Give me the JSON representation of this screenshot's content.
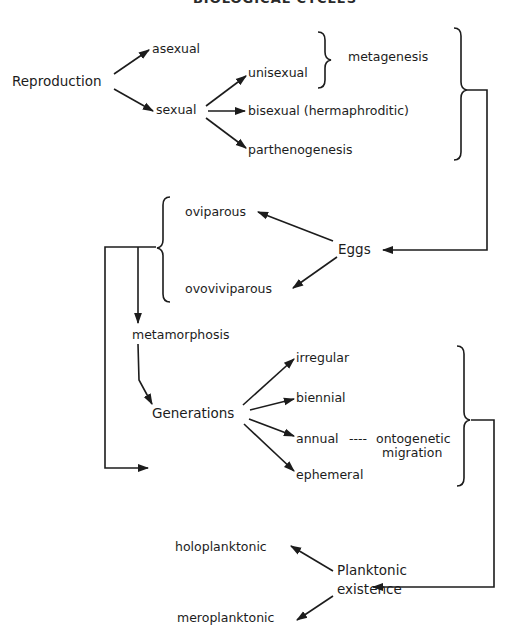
{
  "header": {
    "title": "BIOLOGICAL CYCLES"
  },
  "nodes": {
    "reproduction": "Reproduction",
    "asexual": "asexual",
    "sexual": "sexual",
    "unisexual": "unisexual",
    "metagenesis": "metagenesis",
    "bisexual": "bisexual (hermaphroditic)",
    "parthenogenesis": "parthenogenesis",
    "eggs": "Eggs",
    "oviparous": "oviparous",
    "ovoviviparous": "ovoviviparous",
    "metamorphosis": "metamorphosis",
    "generations": "Generations",
    "irregular": "irregular",
    "biennial": "biennial",
    "annual": "annual",
    "ontogenetic_dashes": "----",
    "ontogenetic": "ontogenetic",
    "migration": "migration",
    "ephemeral": "ephemeral",
    "planktonic": "Planktonic",
    "existence": "existence",
    "holoplanktonic": "holoplanktonic",
    "meroplanktonic": "meroplanktonic"
  },
  "edges": [
    [
      "Reproduction",
      "asexual"
    ],
    [
      "Reproduction",
      "sexual"
    ],
    [
      "sexual",
      "unisexual"
    ],
    [
      "sexual",
      "bisexual (hermaphroditic)"
    ],
    [
      "sexual",
      "parthenogenesis"
    ],
    [
      "unisexual",
      "metagenesis"
    ],
    [
      "sexual group",
      "Eggs"
    ],
    [
      "Eggs",
      "oviparous"
    ],
    [
      "Eggs",
      "ovoviviparous"
    ],
    [
      "egg group",
      "metamorphosis"
    ],
    [
      "metamorphosis",
      "Generations"
    ],
    [
      "egg group",
      "Generations"
    ],
    [
      "Generations",
      "irregular"
    ],
    [
      "Generations",
      "biennial"
    ],
    [
      "Generations",
      "annual"
    ],
    [
      "Generations",
      "ephemeral"
    ],
    [
      "annual",
      "ontogenetic migration"
    ],
    [
      "generation group",
      "Planktonic existence"
    ],
    [
      "Planktonic existence",
      "holoplanktonic"
    ],
    [
      "Planktonic existence",
      "meroplanktonic"
    ]
  ],
  "colors": {
    "ink": "#1c1c1c",
    "background": "#ffffff"
  }
}
